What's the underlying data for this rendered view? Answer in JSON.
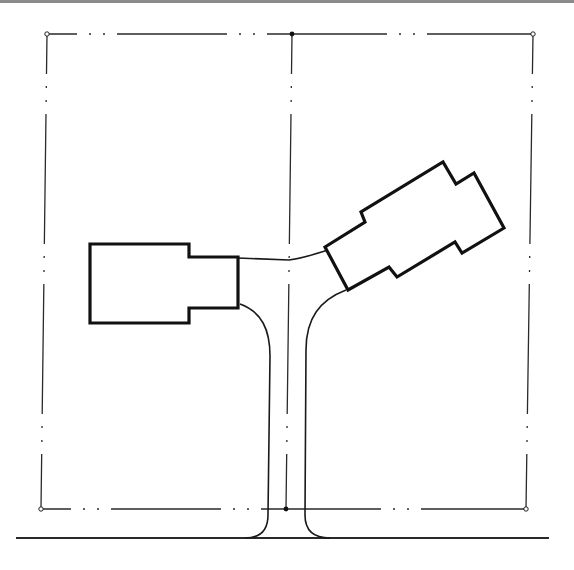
{
  "diagram": {
    "colors": {
      "background": "#ffffff",
      "line": "#1a1a1a",
      "top_bar": "#8a8a8a"
    },
    "lots": [
      {
        "name": "left-lot",
        "corners": [
          [
            47,
            34
          ],
          [
            292,
            34
          ],
          [
            286,
            509
          ],
          [
            41,
            509
          ]
        ]
      },
      {
        "name": "right-lot",
        "corners": [
          [
            292,
            34
          ],
          [
            533,
            34
          ],
          [
            526,
            509
          ],
          [
            286,
            509
          ]
        ]
      }
    ],
    "buildings": [
      {
        "name": "left-building",
        "shape": "notched-rectangle"
      },
      {
        "name": "right-building",
        "shape": "rotated-notched-rectangle"
      }
    ],
    "driveway": {
      "shape": "Y",
      "connects": [
        "left-building",
        "right-building",
        "street"
      ]
    },
    "street": {
      "y": 538
    }
  }
}
